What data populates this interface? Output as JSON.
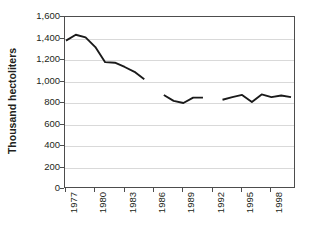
{
  "chart_data": {
    "type": "line",
    "title": "",
    "xlabel": "",
    "ylabel": "Thousand hectoliters",
    "ylim": [
      0,
      1600
    ],
    "ytick_values": [
      0,
      200,
      400,
      600,
      800,
      1000,
      1200,
      1400,
      1600
    ],
    "ytick_labels": [
      "0",
      "200",
      "400",
      "600",
      "800",
      "1,000",
      "1,200",
      "1,400",
      "1,600"
    ],
    "xlim": [
      1977,
      2000
    ],
    "xtick_values": [
      1977,
      1980,
      1983,
      1986,
      1989,
      1992,
      1995,
      1998
    ],
    "xtick_labels": [
      "1977",
      "1980",
      "1983",
      "1986",
      "1989",
      "1992",
      "1995",
      "1998"
    ],
    "grid": "horizontal",
    "legend": "none",
    "line_color": "#1a1a1a",
    "grid_color": "#d9d9d9",
    "frame_color": "#4d4d4d",
    "background_color": "#ffffff",
    "series": [
      {
        "name": "Thousand hectoliters",
        "segments": [
          {
            "x": [
              1977,
              1978,
              1979,
              1980,
              1981,
              1982,
              1983,
              1984,
              1985
            ],
            "y": [
              1380,
              1435,
              1410,
              1320,
              1180,
              1175,
              1135,
              1090,
              1020
            ]
          },
          {
            "x": [
              1987,
              1988,
              1989,
              1990,
              1991
            ],
            "y": [
              875,
              820,
              800,
              850,
              850
            ]
          },
          {
            "x": [
              1993,
              1994,
              1995,
              1996,
              1997,
              1998,
              1999,
              2000
            ],
            "y": [
              830,
              855,
              875,
              810,
              880,
              855,
              870,
              855
            ]
          }
        ]
      }
    ],
    "missing_years": [
      1986,
      1992
    ]
  }
}
